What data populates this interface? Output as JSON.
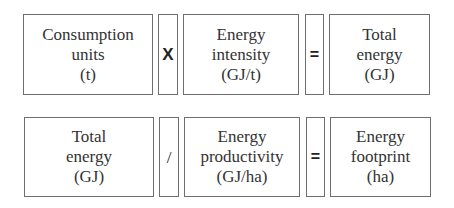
{
  "rows": [
    {
      "operand1": {
        "lines": [
          "Consumption",
          "units",
          "(t)"
        ]
      },
      "operator1": {
        "symbol": "X",
        "meaning": "multiply"
      },
      "operand2": {
        "lines": [
          "Energy",
          "intensity",
          "(GJ/t)"
        ]
      },
      "operator2": {
        "symbol": "=",
        "meaning": "equals"
      },
      "result": {
        "lines": [
          "Total",
          "energy",
          "(GJ)"
        ]
      }
    },
    {
      "operand1": {
        "lines": [
          "Total",
          "energy",
          "(GJ)"
        ]
      },
      "operator1": {
        "symbol": "/",
        "meaning": "divide"
      },
      "operand2": {
        "lines": [
          "Energy",
          "productivity",
          "(GJ/ha)"
        ]
      },
      "operator2": {
        "symbol": "=",
        "meaning": "equals"
      },
      "result": {
        "lines": [
          "Energy",
          "footprint",
          "(ha)"
        ]
      }
    }
  ],
  "colors": {
    "border": "#6e6e6e",
    "text": "#333333",
    "background": "#ffffff"
  }
}
